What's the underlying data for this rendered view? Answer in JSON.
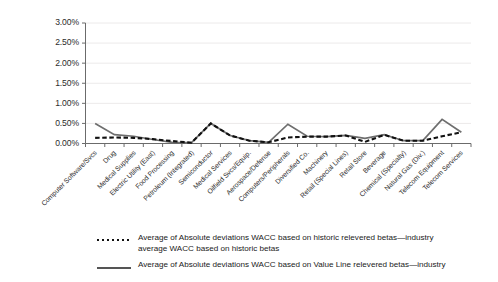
{
  "chart_data": {
    "type": "line",
    "title": "",
    "xlabel": "",
    "ylabel": "",
    "ylim": [
      0,
      0.03
    ],
    "grid": true,
    "legend_position": "bottom",
    "ytick_labels": [
      "0.00%",
      "0.50%",
      "1.00%",
      "1.50%",
      "2.00%",
      "2.50%",
      "3.00%"
    ],
    "ytick_values": [
      0.0,
      0.005,
      0.01,
      0.015,
      0.02,
      0.025,
      0.03
    ],
    "categories": [
      "Computer Software/Svcs",
      "Drug",
      "Medical Supplies",
      "Electric Utility (East)",
      "Food Processing",
      "Petroleum (Integrated)",
      "Semiconductor",
      "Medical Services",
      "Oilfield Svcs/Equip.",
      "Aerospace/Defense",
      "Computers/Peripherals",
      "Diversified Co.",
      "Machinery",
      "Retail (Special Lines)",
      "Retail Store",
      "Beverage",
      "Chemical (Specialty)",
      "Natural Gas (Div.)",
      "Telecom Equipment",
      "Telecom Services"
    ],
    "series": [
      {
        "name": "Average of Absolute deviations WACC based on historic relevered betas—industry average WACC based on historic betas",
        "style": "dotted",
        "color": "#111111",
        "values": [
          0.0014,
          0.0015,
          0.0014,
          0.0011,
          0.0006,
          0.0002,
          0.005,
          0.002,
          0.0007,
          0.0003,
          0.0015,
          0.0017,
          0.0017,
          0.002,
          0.0004,
          0.00215,
          0.0007,
          0.0007,
          0.0018,
          0.0028
        ]
      },
      {
        "name": "Average of Absolute deviations WACC based on Value Line relevered betas—industry",
        "style": "solid",
        "color": "#6e6e6e",
        "values": [
          0.005,
          0.0022,
          0.0018,
          0.001,
          0.0003,
          0.0002,
          0.005,
          0.002,
          0.0007,
          0.0003,
          0.0048,
          0.0018,
          0.0017,
          0.002,
          0.0013,
          0.0022,
          0.0007,
          0.0007,
          0.006,
          0.0028
        ]
      }
    ]
  },
  "legend": {
    "entries": [
      {
        "marker": "dotted-line-swatch",
        "label": "Average of Absolute deviations WACC based on historic relevered betas—industry\naverage WACC based on historic betas"
      },
      {
        "marker": "solid-line-swatch",
        "label": "Average of Absolute deviations WACC based on Value Line relevered betas—industry"
      }
    ]
  },
  "colors": {
    "historic_series": "#111111",
    "value_line_series": "#6e6e6e",
    "axis": "#6b6b6b",
    "grid": "#eceaea",
    "text": "#1a1a1a",
    "background": "#ffffff"
  }
}
